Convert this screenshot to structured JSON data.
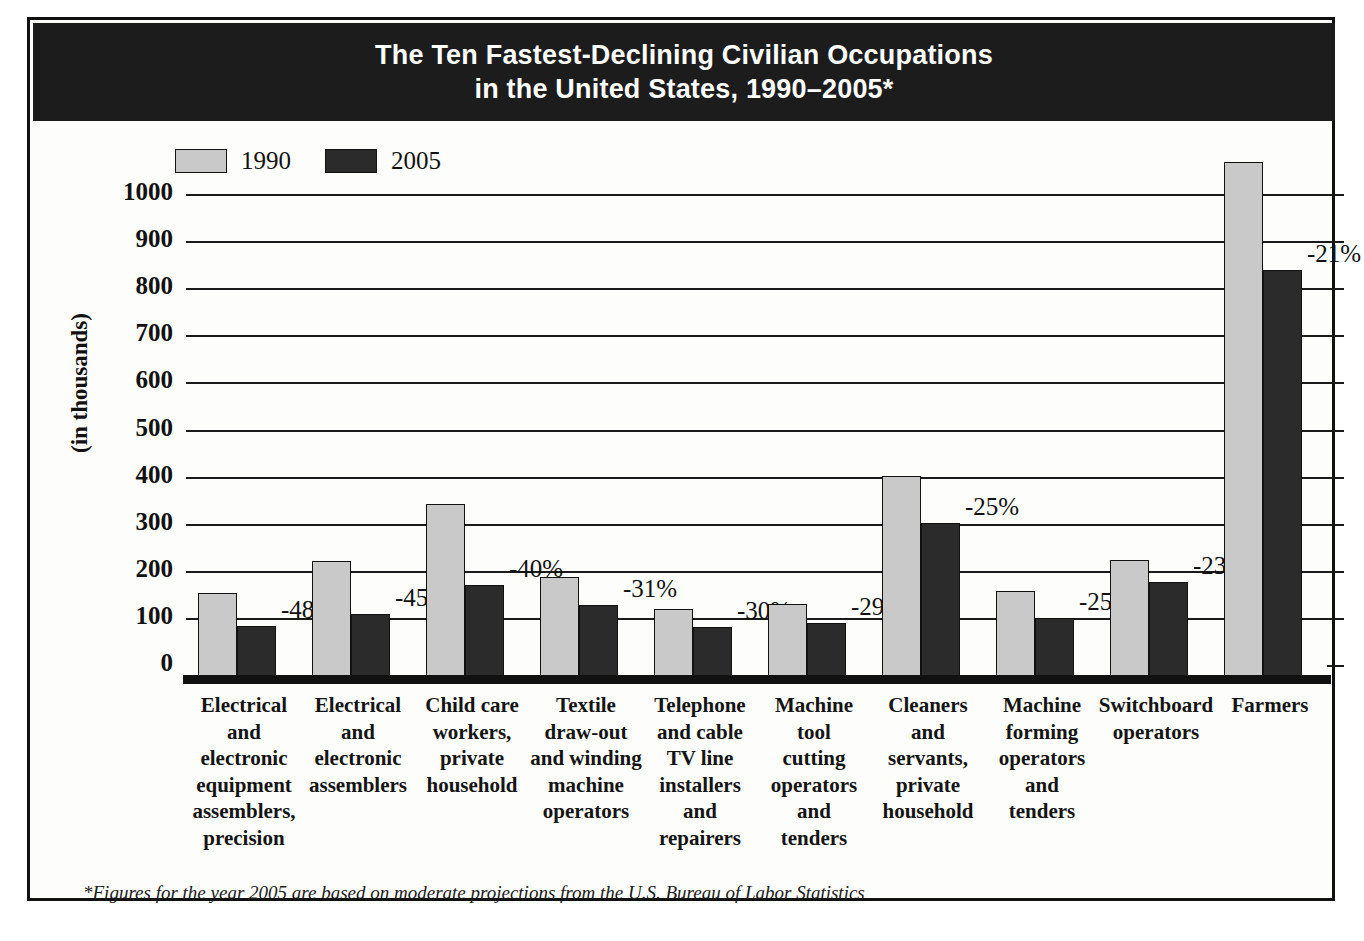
{
  "figure": {
    "title_line1": "The Ten Fastest-Declining Civilian Occupations",
    "title_line2": "in the United States, 1990–2005*",
    "footnote": "*Figures for the year 2005 are based on moderate projections from the U.S. Bureau of Labor Statistics",
    "colors": {
      "series_1990": "#c9c9c9",
      "series_2005": "#2b2b2b",
      "banner": "#1c1c1c",
      "axis": "#111111",
      "background": "#fdfdfb"
    }
  },
  "legend": {
    "position": "top-left",
    "items": [
      {
        "label": "1990",
        "swatch": "#c9c9c9"
      },
      {
        "label": "2005",
        "swatch": "#2b2b2b"
      }
    ]
  },
  "chart_data": {
    "type": "bar",
    "title": "The Ten Fastest-Declining Civilian Occupations in the United States, 1990–2005*",
    "xlabel": "",
    "ylabel": "(in thousands)",
    "ylim": [
      0,
      1000
    ],
    "ytick_step": 100,
    "yticks": [
      "0",
      "100",
      "200",
      "300",
      "400",
      "500",
      "600",
      "700",
      "800",
      "900",
      "1000"
    ],
    "grid": true,
    "legend_position": "top-left",
    "categories": [
      "Electrical and electronic equipment assemblers, precision",
      "Electrical and electronic assemblers",
      "Child care workers, private household",
      "Textile draw-out and winding machine operators",
      "Telephone and cable TV line installers and repairers",
      "Machine tool cutting operators and tenders",
      "Cleaners and servants, private household",
      "Machine forming operators and tenders",
      "Switchboard operators",
      "Farmers"
    ],
    "category_lines": [
      [
        "Electrical",
        "and",
        "electronic",
        "equipment",
        "assemblers,",
        "precision"
      ],
      [
        "Electrical",
        "and",
        "electronic",
        "assemblers"
      ],
      [
        "Child care",
        "workers,",
        "private",
        "household"
      ],
      [
        "Textile",
        "draw-out",
        "and winding",
        "machine",
        "operators"
      ],
      [
        "Telephone",
        "and cable",
        "TV line",
        "installers",
        "and",
        "repairers"
      ],
      [
        "Machine",
        "tool",
        "cutting",
        "operators",
        "and",
        "tenders"
      ],
      [
        "Cleaners",
        "and",
        "servants,",
        "private",
        "household"
      ],
      [
        "Machine",
        "forming",
        "operators",
        "and",
        "tenders"
      ],
      [
        "Switchboard",
        "operators"
      ],
      [
        "Farmers"
      ]
    ],
    "series": [
      {
        "name": "1990",
        "values": [
          190,
          257,
          379,
          223,
          154,
          166,
          437,
          194,
          260,
          1105
        ]
      },
      {
        "name": "2005",
        "values": [
          118,
          145,
          205,
          163,
          116,
          126,
          337,
          136,
          213,
          875
        ]
      }
    ],
    "change_labels": [
      "-48%",
      "-45%",
      "-40%",
      "-31%",
      "-30%",
      "-29%",
      "-25%",
      "-25%",
      "-23%",
      "-21%"
    ],
    "annotations": [
      "-48%",
      "-45%",
      "-40%",
      "-31%",
      "-30%",
      "-29%",
      "-25%",
      "-25%",
      "-23%",
      "-21%"
    ],
    "units": "thousands of workers"
  }
}
